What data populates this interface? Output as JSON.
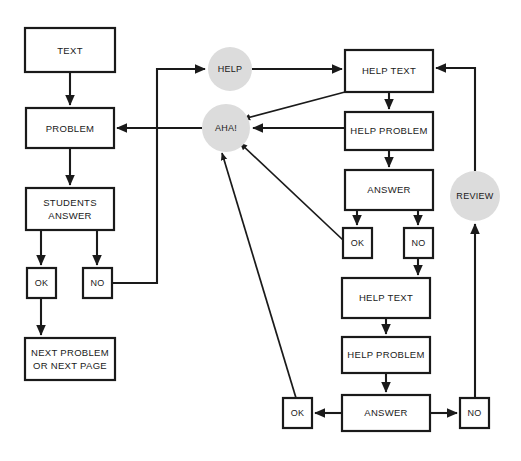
{
  "diagram": {
    "colors": {
      "background": "#ffffff",
      "box_fill": "#ffffff",
      "stroke": "#1a1a1a",
      "circle_fill": "#dcdcdc"
    },
    "nodes": [
      {
        "id": "text",
        "label": "TEXT",
        "shape": "rect",
        "x": 25,
        "y": 28,
        "w": 90,
        "h": 44
      },
      {
        "id": "problem",
        "label": "PROBLEM",
        "shape": "rect",
        "x": 26,
        "y": 108,
        "w": 88,
        "h": 40
      },
      {
        "id": "students",
        "label_line1": "STUDENTS",
        "label_line2": "ANSWER",
        "shape": "rect",
        "x": 26,
        "y": 188,
        "w": 88,
        "h": 42
      },
      {
        "id": "ok_left",
        "label": "OK",
        "shape": "rect",
        "x": 27,
        "y": 268,
        "w": 29,
        "h": 30
      },
      {
        "id": "no_left",
        "label": "NO",
        "shape": "rect",
        "x": 83,
        "y": 268,
        "w": 29,
        "h": 30
      },
      {
        "id": "next",
        "label_line1": "NEXT PROBLEM",
        "label_line2": "OR NEXT PAGE",
        "shape": "rect",
        "x": 25,
        "y": 338,
        "w": 90,
        "h": 42
      },
      {
        "id": "help",
        "label": "HELP",
        "shape": "circle",
        "cx": 230,
        "cy": 69,
        "r": 22
      },
      {
        "id": "aha",
        "label": "AHA!",
        "shape": "circle",
        "cx": 226,
        "cy": 128,
        "r": 24
      },
      {
        "id": "review",
        "label": "REVIEW",
        "shape": "circle",
        "cx": 475,
        "cy": 196,
        "r": 25
      },
      {
        "id": "help_text_1",
        "label": "HELP TEXT",
        "shape": "rect",
        "x": 345,
        "y": 50,
        "w": 88,
        "h": 42
      },
      {
        "id": "help_prob_1",
        "label": "HELP PROBLEM",
        "shape": "rect",
        "x": 345,
        "y": 112,
        "w": 88,
        "h": 38
      },
      {
        "id": "answer_1",
        "label": "ANSWER",
        "shape": "rect",
        "x": 345,
        "y": 170,
        "w": 88,
        "h": 40
      },
      {
        "id": "ok_mid",
        "label": "OK",
        "shape": "rect",
        "x": 343,
        "y": 228,
        "w": 29,
        "h": 30
      },
      {
        "id": "no_mid",
        "label": "NO",
        "shape": "rect",
        "x": 404,
        "y": 228,
        "w": 29,
        "h": 30
      },
      {
        "id": "help_text_2",
        "label": "HELP TEXT",
        "shape": "rect",
        "x": 342,
        "y": 278,
        "w": 88,
        "h": 40
      },
      {
        "id": "help_prob_2",
        "label": "HELP PROBLEM",
        "shape": "rect",
        "x": 342,
        "y": 337,
        "w": 88,
        "h": 36
      },
      {
        "id": "answer_2",
        "label": "ANSWER",
        "shape": "rect",
        "x": 342,
        "y": 395,
        "w": 88,
        "h": 36
      },
      {
        "id": "ok_bottom",
        "label": "OK",
        "shape": "rect",
        "x": 283,
        "y": 398,
        "w": 29,
        "h": 30
      },
      {
        "id": "no_bottom",
        "label": "NO",
        "shape": "rect",
        "x": 460,
        "y": 398,
        "w": 29,
        "h": 30
      }
    ],
    "edges": [
      {
        "id": "e-text-problem",
        "from": "text",
        "to": "problem",
        "kind": "straight-down"
      },
      {
        "id": "e-problem-students",
        "from": "problem",
        "to": "students",
        "kind": "straight-down"
      },
      {
        "id": "e-students-ok",
        "from": "students",
        "to": "ok_left",
        "kind": "straight-down"
      },
      {
        "id": "e-students-no",
        "from": "students",
        "to": "no_left",
        "kind": "straight-down"
      },
      {
        "id": "e-ok-next",
        "from": "ok_left",
        "to": "next",
        "kind": "straight-down"
      },
      {
        "id": "e-no-help",
        "from": "no_left",
        "to": "help",
        "kind": "orthogonal"
      },
      {
        "id": "e-help-helptext",
        "from": "help",
        "to": "help_text_1",
        "kind": "straight-right"
      },
      {
        "id": "e-aha-problem",
        "from": "aha",
        "to": "problem",
        "kind": "straight-left"
      },
      {
        "id": "e-helptext-aha",
        "from": "help_text_1",
        "to": "aha",
        "kind": "diagonal"
      },
      {
        "id": "e-helptext-helpprob",
        "from": "help_text_1",
        "to": "help_prob_1",
        "kind": "straight-down"
      },
      {
        "id": "e-helpprob-aha",
        "from": "help_prob_1",
        "to": "aha",
        "kind": "straight-left"
      },
      {
        "id": "e-helpprob-answer",
        "from": "help_prob_1",
        "to": "answer_1",
        "kind": "straight-down"
      },
      {
        "id": "e-answer-okmid",
        "from": "answer_1",
        "to": "ok_mid",
        "kind": "straight-down"
      },
      {
        "id": "e-answer-nomid",
        "from": "answer_1",
        "to": "no_mid",
        "kind": "straight-down"
      },
      {
        "id": "e-okmid-aha",
        "from": "ok_mid",
        "to": "aha",
        "kind": "diagonal"
      },
      {
        "id": "e-nomid-helptext2",
        "from": "no_mid",
        "to": "help_text_2",
        "kind": "straight-down"
      },
      {
        "id": "e-helptext2-helpprob2",
        "from": "help_text_2",
        "to": "help_prob_2",
        "kind": "straight-down"
      },
      {
        "id": "e-helpprob2-answer2",
        "from": "help_prob_2",
        "to": "answer_2",
        "kind": "straight-down"
      },
      {
        "id": "e-answer2-okbottom",
        "from": "answer_2",
        "to": "ok_bottom",
        "kind": "straight-left"
      },
      {
        "id": "e-answer2-nobottom",
        "from": "answer_2",
        "to": "no_bottom",
        "kind": "straight-right"
      },
      {
        "id": "e-okbottom-aha",
        "from": "ok_bottom",
        "to": "aha",
        "kind": "diagonal"
      },
      {
        "id": "e-nobottom-review",
        "from": "no_bottom",
        "to": "review",
        "kind": "orthogonal"
      },
      {
        "id": "e-review-helptext",
        "from": "review",
        "to": "help_text_1",
        "kind": "orthogonal"
      }
    ]
  }
}
